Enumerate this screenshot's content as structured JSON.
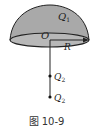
{
  "figure": {
    "caption": "图 10-9",
    "hemisphere": {
      "charge_label": "Q",
      "charge_sub": "1",
      "center_label": "O",
      "radius_label": "R",
      "fill_color": "#a9a9a9",
      "base_fill_color": "#b8b8b8"
    },
    "point_charges": [
      {
        "label": "Q",
        "sub": "2"
      },
      {
        "label": "Q",
        "sub": "2"
      }
    ]
  }
}
